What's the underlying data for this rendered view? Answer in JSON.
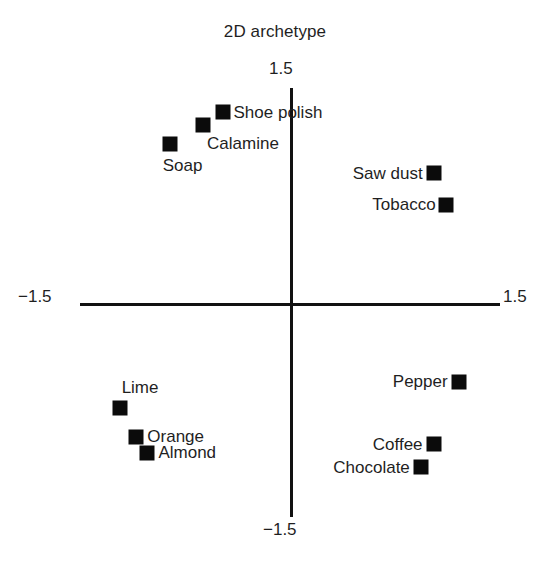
{
  "chart_data": {
    "type": "scatter",
    "title": "2D archetype",
    "xlabel": "",
    "ylabel": "",
    "xlim": [
      -1.5,
      1.5
    ],
    "ylim": [
      -1.5,
      1.5
    ],
    "grid": false,
    "legend": null,
    "axis_tick_labels": {
      "top": "1.5",
      "bottom": "−1.5",
      "left": "−1.5",
      "right": "1.5"
    },
    "marker_style": "filled-square",
    "marker_color": "#0b0b0b",
    "points": [
      {
        "label": "Shoe polish",
        "x": -0.5,
        "y": 1.33,
        "label_position": "right"
      },
      {
        "label": "Calamine",
        "x": -0.64,
        "y": 1.24,
        "label_position": "below-right"
      },
      {
        "label": "Soap",
        "x": -0.88,
        "y": 1.11,
        "label_position": "below"
      },
      {
        "label": "Saw dust",
        "x": 1.02,
        "y": 0.91,
        "label_position": "left"
      },
      {
        "label": "Tobacco",
        "x": 1.11,
        "y": 0.69,
        "label_position": "left"
      },
      {
        "label": "Lime",
        "x": -1.24,
        "y": -0.71,
        "label_position": "above-right"
      },
      {
        "label": "Orange",
        "x": -1.12,
        "y": -0.91,
        "label_position": "right"
      },
      {
        "label": "Almond",
        "x": -1.04,
        "y": -1.02,
        "label_position": "right"
      },
      {
        "label": "Pepper",
        "x": 1.2,
        "y": -0.53,
        "label_position": "left"
      },
      {
        "label": "Coffee",
        "x": 1.02,
        "y": -0.96,
        "label_position": "left"
      },
      {
        "label": "Chocolate",
        "x": 0.93,
        "y": -1.12,
        "label_position": "left"
      }
    ]
  },
  "layout": {
    "origin_px": {
      "x": 292,
      "y": 305
    },
    "scale_px_per_unit": {
      "x": 139,
      "y": 145
    }
  }
}
